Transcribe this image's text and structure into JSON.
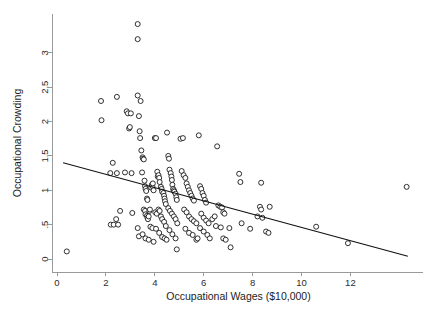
{
  "chart_data": {
    "type": "scatter",
    "title": "",
    "xlabel": "Occupational Wages ($10,000)",
    "ylabel": "Occupational Crowding",
    "xlim": [
      -0.35,
      15.2
    ],
    "ylim": [
      -0.06,
      3.55
    ],
    "xticks": [
      0,
      2,
      4,
      6,
      8,
      10,
      12
    ],
    "xticklabels": [
      "0",
      "2",
      "4",
      "6",
      "8",
      "10",
      "12"
    ],
    "yticks": [
      0,
      0.5,
      1,
      1.5,
      2,
      2.5,
      3
    ],
    "yticklabels": [
      "0",
      ".5",
      "1",
      "1.5",
      "2",
      "2.5",
      "3"
    ],
    "grid": false,
    "legend": null,
    "marker": "open-circle",
    "marker_color": "#1a1a1a",
    "marker_fill": "#ffffff",
    "fit_line": {
      "label": "linear fit",
      "color": "#111111",
      "x": [
        0.25,
        14.35
      ],
      "y": [
        1.4,
        0.04
      ],
      "intercept": 1.424,
      "slope": -0.0965
    },
    "points": [
      [
        0.4,
        0.11
      ],
      [
        1.8,
        2.3
      ],
      [
        1.82,
        2.02
      ],
      [
        2.18,
        1.25
      ],
      [
        2.2,
        0.5
      ],
      [
        2.32,
        0.5
      ],
      [
        2.45,
        2.36
      ],
      [
        2.45,
        1.25
      ],
      [
        2.42,
        0.58
      ],
      [
        2.5,
        0.5
      ],
      [
        2.28,
        1.4
      ],
      [
        2.58,
        0.7
      ],
      [
        2.78,
        1.26
      ],
      [
        2.85,
        2.15
      ],
      [
        2.9,
        2.12
      ],
      [
        2.95,
        1.9
      ],
      [
        2.98,
        1.92
      ],
      [
        3.02,
        2.12
      ],
      [
        3.05,
        1.25
      ],
      [
        3.08,
        0.67
      ],
      [
        3.3,
        3.42
      ],
      [
        3.3,
        3.2
      ],
      [
        3.3,
        2.38
      ],
      [
        3.35,
        2.08
      ],
      [
        3.38,
        1.86
      ],
      [
        3.4,
        1.76
      ],
      [
        3.42,
        2.3
      ],
      [
        3.45,
        1.58
      ],
      [
        3.48,
        1.26
      ],
      [
        3.5,
        1.48
      ],
      [
        3.52,
        1.46
      ],
      [
        3.55,
        1.45
      ],
      [
        3.58,
        1.14
      ],
      [
        3.6,
        1.06
      ],
      [
        3.62,
        1.02
      ],
      [
        3.65,
        0.99
      ],
      [
        3.68,
        0.88
      ],
      [
        3.7,
        0.86
      ],
      [
        3.55,
        0.72
      ],
      [
        3.6,
        0.7
      ],
      [
        3.62,
        0.65
      ],
      [
        3.68,
        0.63
      ],
      [
        3.7,
        0.6
      ],
      [
        3.72,
        0.58
      ],
      [
        3.75,
        0.62
      ],
      [
        3.78,
        0.7
      ],
      [
        3.8,
        0.72
      ],
      [
        3.85,
        1.04
      ],
      [
        3.88,
        1.08
      ],
      [
        3.9,
        1.06
      ],
      [
        3.92,
        1.1
      ],
      [
        3.95,
        1.0
      ],
      [
        3.3,
        0.45
      ],
      [
        3.35,
        0.33
      ],
      [
        3.5,
        0.36
      ],
      [
        3.62,
        0.3
      ],
      [
        3.75,
        0.28
      ],
      [
        3.82,
        0.47
      ],
      [
        3.9,
        0.45
      ],
      [
        3.95,
        0.25
      ],
      [
        4.0,
        1.76
      ],
      [
        4.05,
        1.76
      ],
      [
        4.1,
        1.27
      ],
      [
        4.12,
        1.2
      ],
      [
        4.15,
        1.22
      ],
      [
        4.18,
        1.18
      ],
      [
        4.2,
        1.12
      ],
      [
        4.25,
        1.05
      ],
      [
        4.28,
        1.02
      ],
      [
        4.3,
        0.98
      ],
      [
        4.35,
        0.96
      ],
      [
        4.38,
        0.92
      ],
      [
        4.4,
        0.88
      ],
      [
        4.42,
        0.84
      ],
      [
        4.45,
        0.8
      ],
      [
        4.02,
        0.68
      ],
      [
        4.08,
        0.66
      ],
      [
        4.15,
        0.72
      ],
      [
        4.2,
        0.7
      ],
      [
        4.25,
        0.62
      ],
      [
        4.3,
        0.58
      ],
      [
        4.38,
        0.54
      ],
      [
        4.45,
        0.48
      ],
      [
        4.05,
        0.44
      ],
      [
        4.18,
        0.38
      ],
      [
        4.3,
        0.32
      ],
      [
        4.4,
        0.3
      ],
      [
        4.48,
        0.28
      ],
      [
        4.5,
        1.84
      ],
      [
        4.55,
        1.5
      ],
      [
        4.58,
        1.46
      ],
      [
        4.6,
        1.3
      ],
      [
        4.65,
        1.25
      ],
      [
        4.68,
        1.2
      ],
      [
        4.7,
        1.15
      ],
      [
        4.72,
        1.08
      ],
      [
        4.75,
        1.02
      ],
      [
        4.78,
        1.0
      ],
      [
        4.8,
        0.98
      ],
      [
        4.85,
        0.95
      ],
      [
        4.88,
        0.9
      ],
      [
        4.9,
        0.86
      ],
      [
        4.55,
        0.74
      ],
      [
        4.62,
        0.7
      ],
      [
        4.7,
        0.66
      ],
      [
        4.78,
        0.62
      ],
      [
        4.85,
        0.58
      ],
      [
        4.92,
        0.52
      ],
      [
        4.6,
        0.42
      ],
      [
        4.72,
        0.36
      ],
      [
        4.85,
        0.3
      ],
      [
        4.9,
        0.14
      ],
      [
        5.05,
        1.75
      ],
      [
        5.15,
        1.76
      ],
      [
        5.1,
        1.28
      ],
      [
        5.18,
        1.22
      ],
      [
        5.25,
        1.18
      ],
      [
        5.3,
        1.1
      ],
      [
        5.35,
        1.05
      ],
      [
        5.4,
        1.0
      ],
      [
        5.45,
        0.96
      ],
      [
        5.5,
        0.92
      ],
      [
        5.55,
        0.88
      ],
      [
        5.6,
        0.85
      ],
      [
        5.2,
        0.72
      ],
      [
        5.3,
        0.68
      ],
      [
        5.4,
        0.62
      ],
      [
        5.5,
        0.58
      ],
      [
        5.6,
        0.55
      ],
      [
        5.7,
        0.52
      ],
      [
        5.25,
        0.44
      ],
      [
        5.4,
        0.38
      ],
      [
        5.55,
        0.35
      ],
      [
        5.7,
        0.28
      ],
      [
        5.75,
        0.3
      ],
      [
        5.8,
        1.8
      ],
      [
        5.85,
        1.06
      ],
      [
        5.9,
        1.02
      ],
      [
        5.95,
        0.96
      ],
      [
        6.0,
        0.92
      ],
      [
        6.05,
        0.86
      ],
      [
        6.1,
        0.82
      ],
      [
        5.9,
        0.66
      ],
      [
        6.0,
        0.6
      ],
      [
        6.1,
        0.56
      ],
      [
        6.2,
        0.52
      ],
      [
        5.85,
        0.45
      ],
      [
        6.0,
        0.4
      ],
      [
        6.15,
        0.35
      ],
      [
        6.25,
        0.3
      ],
      [
        6.35,
        0.58
      ],
      [
        6.45,
        0.62
      ],
      [
        6.5,
        0.48
      ],
      [
        6.55,
        1.64
      ],
      [
        6.6,
        0.78
      ],
      [
        6.68,
        0.76
      ],
      [
        6.75,
        0.75
      ],
      [
        6.8,
        0.68
      ],
      [
        6.85,
        0.66
      ],
      [
        6.7,
        0.46
      ],
      [
        6.8,
        0.3
      ],
      [
        6.9,
        0.28
      ],
      [
        7.05,
        0.45
      ],
      [
        7.1,
        0.17
      ],
      [
        7.45,
        1.24
      ],
      [
        7.5,
        1.12
      ],
      [
        7.55,
        0.52
      ],
      [
        7.9,
        0.44
      ],
      [
        8.2,
        0.62
      ],
      [
        8.3,
        0.76
      ],
      [
        8.35,
        0.72
      ],
      [
        8.35,
        1.11
      ],
      [
        8.4,
        0.6
      ],
      [
        8.55,
        0.4
      ],
      [
        8.65,
        0.38
      ],
      [
        8.7,
        0.76
      ],
      [
        10.6,
        0.47
      ],
      [
        11.9,
        0.23
      ],
      [
        14.3,
        1.05
      ]
    ]
  },
  "figure": {
    "background": "#ffffff",
    "axis_color": "#9a9a9a",
    "text_color": "#1c1c1c"
  }
}
